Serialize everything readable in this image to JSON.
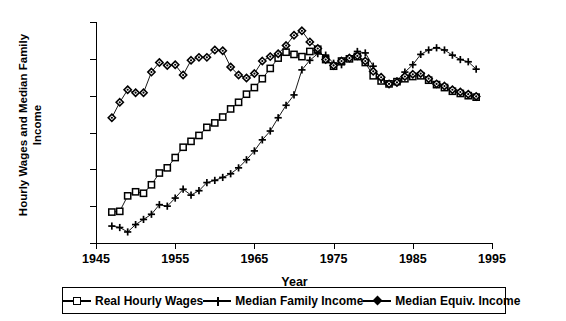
{
  "chart_data": {
    "type": "line",
    "title": "",
    "xlabel": "Year",
    "ylabel": "Hourly Wages and Median Family Income",
    "ylabel_line1": "Hourly Wages and Median Family",
    "ylabel_line2": "Income",
    "xlim": [
      1945,
      1995
    ],
    "ylim": [
      50,
      110
    ],
    "xticks": [
      1945,
      1955,
      1965,
      1975,
      1985,
      1995
    ],
    "yticks": [
      50,
      60,
      70,
      80,
      90,
      100,
      110
    ],
    "grid": false,
    "legend_position": "bottom",
    "colors": {
      "line": "#000000",
      "background": "#ffffff"
    },
    "series": [
      {
        "name": "Real Hourly Wages",
        "marker": "square",
        "x": [
          1947,
          1948,
          1949,
          1950,
          1951,
          1952,
          1953,
          1954,
          1955,
          1956,
          1957,
          1958,
          1959,
          1960,
          1961,
          1962,
          1963,
          1964,
          1965,
          1966,
          1967,
          1968,
          1969,
          1970,
          1971,
          1972,
          1973,
          1974,
          1975,
          1976,
          1977,
          1978,
          1979,
          1980,
          1981,
          1982,
          1983,
          1984,
          1985,
          1986,
          1987,
          1988,
          1989,
          1990,
          1991,
          1992,
          1993
        ],
        "values": [
          58.4,
          58.6,
          62.8,
          63.9,
          63.5,
          65.8,
          69.0,
          70.4,
          73.2,
          76.0,
          77.6,
          79.2,
          81.4,
          82.6,
          84.2,
          86.4,
          88.2,
          90.4,
          92.2,
          94.6,
          97.4,
          100.2,
          101.8,
          101.2,
          100.6,
          102.0,
          102.6,
          99.8,
          98.0,
          99.4,
          100.0,
          100.6,
          99.0,
          95.4,
          94.0,
          93.2,
          93.8,
          94.6,
          95.2,
          95.4,
          94.2,
          93.0,
          92.2,
          91.2,
          90.6,
          90.0,
          89.6
        ]
      },
      {
        "name": "Median Family Income",
        "marker": "plus",
        "x": [
          1947,
          1948,
          1949,
          1950,
          1951,
          1952,
          1953,
          1954,
          1955,
          1956,
          1957,
          1958,
          1959,
          1960,
          1961,
          1962,
          1963,
          1964,
          1965,
          1966,
          1967,
          1968,
          1969,
          1970,
          1971,
          1972,
          1973,
          1974,
          1975,
          1976,
          1977,
          1978,
          1979,
          1980,
          1981,
          1982,
          1983,
          1984,
          1985,
          1986,
          1987,
          1988,
          1989,
          1990,
          1991,
          1992,
          1993
        ],
        "values": [
          54.6,
          54.2,
          53.0,
          55.0,
          56.4,
          57.8,
          60.4,
          60.0,
          62.2,
          64.6,
          63.0,
          64.2,
          66.4,
          67.0,
          67.8,
          68.8,
          70.4,
          72.6,
          75.0,
          78.0,
          80.4,
          84.0,
          87.4,
          90.2,
          97.0,
          99.6,
          101.4,
          101.0,
          98.8,
          98.4,
          100.2,
          102.0,
          101.6,
          98.0,
          94.4,
          93.0,
          94.0,
          96.4,
          98.4,
          101.2,
          102.4,
          103.0,
          102.4,
          101.0,
          99.8,
          99.2,
          97.2
        ]
      },
      {
        "name": "Median Equiv. Income",
        "marker": "diamond",
        "x": [
          1947,
          1948,
          1949,
          1950,
          1951,
          1952,
          1953,
          1954,
          1955,
          1956,
          1957,
          1958,
          1959,
          1960,
          1961,
          1962,
          1963,
          1964,
          1965,
          1966,
          1967,
          1968,
          1969,
          1970,
          1971,
          1972,
          1973,
          1974,
          1975,
          1976,
          1977,
          1978,
          1979,
          1980,
          1981,
          1982,
          1983,
          1984,
          1985,
          1986,
          1987,
          1988,
          1989,
          1990,
          1991,
          1992,
          1993
        ],
        "values": [
          84.0,
          88.2,
          91.6,
          90.8,
          90.8,
          96.4,
          99.0,
          98.2,
          98.4,
          95.6,
          99.6,
          100.4,
          100.4,
          102.4,
          102.2,
          97.8,
          95.6,
          94.8,
          96.0,
          99.4,
          100.6,
          101.4,
          103.6,
          106.4,
          107.6,
          104.6,
          102.8,
          99.8,
          98.2,
          99.4,
          100.2,
          100.8,
          99.4,
          96.6,
          95.0,
          93.2,
          93.6,
          95.2,
          95.8,
          96.0,
          94.6,
          93.2,
          92.6,
          91.6,
          91.0,
          90.4,
          89.8
        ]
      }
    ]
  },
  "legend": {
    "items": [
      {
        "label": "Real Hourly Wages",
        "marker": "square"
      },
      {
        "label": "Median Family Income",
        "marker": "plus"
      },
      {
        "label": "Median Equiv. Income",
        "marker": "diamond"
      }
    ]
  }
}
